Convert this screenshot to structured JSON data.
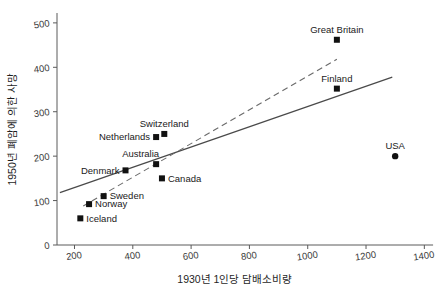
{
  "chart_data": {
    "type": "scatter",
    "title": "",
    "xlabel": "1930년 1인당 담배소비량",
    "ylabel": "1950년 폐암에 의한 사망",
    "xlim": [
      140,
      1440
    ],
    "ylim": [
      0,
      520
    ],
    "xticks": [
      200,
      400,
      600,
      800,
      1000,
      1200,
      1400
    ],
    "yticks": [
      0,
      100,
      200,
      300,
      400,
      500
    ],
    "grid": false,
    "legend": "none",
    "points": [
      {
        "label": "Iceland",
        "x": 220,
        "y": 60,
        "marker": "square",
        "label_pos": "right"
      },
      {
        "label": "Norway",
        "x": 250,
        "y": 92,
        "marker": "square",
        "label_pos": "right"
      },
      {
        "label": "Sweden",
        "x": 300,
        "y": 110,
        "marker": "square",
        "label_pos": "right"
      },
      {
        "label": "Denmark",
        "x": 375,
        "y": 168,
        "marker": "square",
        "label_pos": "left"
      },
      {
        "label": "Canada",
        "x": 500,
        "y": 150,
        "marker": "square",
        "label_pos": "right"
      },
      {
        "label": "Australia",
        "x": 480,
        "y": 182,
        "marker": "square",
        "label_pos": "above-left"
      },
      {
        "label": "Netherlands",
        "x": 480,
        "y": 243,
        "marker": "square",
        "label_pos": "left"
      },
      {
        "label": "Switzerland",
        "x": 508,
        "y": 250,
        "marker": "square",
        "label_pos": "above"
      },
      {
        "label": "Finland",
        "x": 1100,
        "y": 352,
        "marker": "square",
        "label_pos": "above"
      },
      {
        "label": "Great Britain",
        "x": 1100,
        "y": 462,
        "marker": "square",
        "label_pos": "above"
      },
      {
        "label": "USA",
        "x": 1300,
        "y": 200,
        "marker": "circle",
        "label_pos": "above"
      }
    ],
    "trendlines": [
      {
        "name": "solid-regression-line",
        "style": "solid",
        "x0": 150,
        "y0": 118,
        "x1": 1290,
        "y1": 378
      },
      {
        "name": "dashed-regression-line",
        "style": "dashed",
        "x0": 230,
        "y0": 88,
        "x1": 1100,
        "y1": 418
      }
    ]
  },
  "axes": {
    "x_tick_labels": [
      "200",
      "400",
      "600",
      "800",
      "1000",
      "1200",
      "1400"
    ],
    "y_tick_labels": [
      "0",
      "100",
      "200",
      "300",
      "400",
      "500"
    ]
  }
}
